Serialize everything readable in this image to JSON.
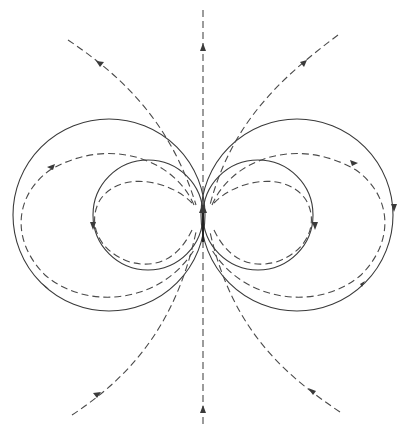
{
  "diagram": {
    "type": "field-lines",
    "colors": {
      "background": "#ffffff",
      "line": "#3a3a3a",
      "dashed_line": "#4a4a4a"
    },
    "center": {
      "x": 203,
      "y": 215
    },
    "dipole_arrow": {
      "x": 203,
      "y_tail": 242,
      "y_head": 205,
      "direction": "up"
    },
    "solid_circles": [
      {
        "cx": 148,
        "cy": 215,
        "r": 55
      },
      {
        "cx": 258,
        "cy": 215,
        "r": 55
      },
      {
        "cx": 109,
        "cy": 215,
        "r": 96
      },
      {
        "cx": 297,
        "cy": 215,
        "r": 96
      }
    ],
    "dashed_loops": [
      {
        "side": "left",
        "rx": 52,
        "ry": 40,
        "cx": 148
      },
      {
        "side": "right",
        "rx": 52,
        "ry": 40,
        "cx": 258
      },
      {
        "side": "left",
        "rx": 95,
        "ry": 75,
        "cx": 109
      },
      {
        "side": "right",
        "rx": 95,
        "ry": 75,
        "cx": 297
      }
    ],
    "open_field_lines": [
      "vertical-axis",
      "upper-left",
      "upper-right",
      "lower-left",
      "lower-right"
    ]
  }
}
